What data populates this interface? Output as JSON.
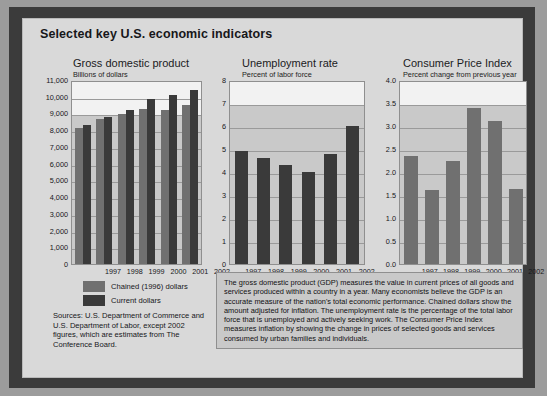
{
  "page_title": "Selected key U.S. economic indicators",
  "colors": {
    "frame": "#3b3b3b",
    "panel": "#d9d9d9",
    "plot_bg": "#c9c9c9",
    "series_light": "#707070",
    "series_dark": "#3a3a3a"
  },
  "legend": {
    "items": [
      {
        "label": "Chained (1996) dollars",
        "swatch": "light"
      },
      {
        "label": "Current dollars",
        "swatch": "dark"
      }
    ]
  },
  "sources": "Sources: U.S. Department of Commerce and U.S. Department of Labor, except 2002 figures, which are estimates from The Conference Board.",
  "note": "The gross domestic product (GDP) measures the value in current prices of all goods and services produced within a country in a year. Many economists believe the GDP is an accurate measure of the nation's total economic performance. Chained dollars show the amount adjusted for inflation. The unemployment rate is the percentage of the total labor force that is unemployed and actively seeking work. The Consumer Price Index measures inflation by showing the change in prices of selected goods and services consumed by urban families and individuals.",
  "chart_data": [
    {
      "type": "bar",
      "id": "gdp",
      "title": "Gross domestic product",
      "subtitle": "Billions of dollars",
      "xlabel": "",
      "ylabel": "Billions of dollars",
      "categories": [
        "1997",
        "1998",
        "1999",
        "2000",
        "2001",
        "2002"
      ],
      "ylim": [
        0,
        11000
      ],
      "yticks": [
        "11,000",
        "10,000",
        "9,000",
        "8,000",
        "7,000",
        "6,000",
        "5,000",
        "4,000",
        "3,000",
        "2,000",
        "1,000",
        "0"
      ],
      "ytick_values": [
        11000,
        10000,
        9000,
        8000,
        7000,
        6000,
        5000,
        4000,
        3000,
        2000,
        1000,
        0
      ],
      "grid": true,
      "legend_position": "below-left",
      "series": [
        {
          "name": "Chained (1996) dollars",
          "color": "#707070",
          "values": [
            8160,
            8680,
            8960,
            9240,
            9220,
            9520
          ]
        },
        {
          "name": "Current dollars",
          "color": "#3a3a3a",
          "values": [
            8300,
            8790,
            9220,
            9870,
            10100,
            10420
          ]
        }
      ]
    },
    {
      "type": "bar",
      "id": "unemployment",
      "title": "Unemployment rate",
      "subtitle": "Percent of labor force",
      "xlabel": "",
      "ylabel": "Percent of labor force",
      "categories": [
        "1997",
        "1998",
        "1999",
        "2000",
        "2001",
        "2002"
      ],
      "ylim": [
        0,
        8
      ],
      "yticks": [
        "8",
        "7",
        "6",
        "5",
        "4",
        "3",
        "2",
        "1",
        "0"
      ],
      "ytick_values": [
        8,
        7,
        6,
        5,
        4,
        3,
        2,
        1,
        0
      ],
      "grid": true,
      "series": [
        {
          "name": "Unemployment rate",
          "color": "#3a3a3a",
          "values": [
            4.9,
            4.6,
            4.3,
            4.0,
            4.8,
            6.0
          ]
        }
      ]
    },
    {
      "type": "bar",
      "id": "cpi",
      "title": "Consumer Price Index",
      "subtitle": "Percent change from previous year",
      "xlabel": "",
      "ylabel": "Percent change from previous year",
      "categories": [
        "1997",
        "1998",
        "1999",
        "2000",
        "2001",
        "2002"
      ],
      "ylim": [
        0,
        4
      ],
      "yticks": [
        "4.0",
        "3.5",
        "3.0",
        "2.5",
        "2.0",
        "1.5",
        "1.0",
        "0.5",
        "0.0"
      ],
      "ytick_values": [
        4.0,
        3.5,
        3.0,
        2.5,
        2.0,
        1.5,
        1.0,
        0.5,
        0.0
      ],
      "grid": true,
      "series": [
        {
          "name": "Consumer Price Index",
          "color": "#707070",
          "values": [
            2.35,
            1.6,
            2.25,
            3.4,
            3.1,
            1.62
          ]
        }
      ]
    }
  ]
}
